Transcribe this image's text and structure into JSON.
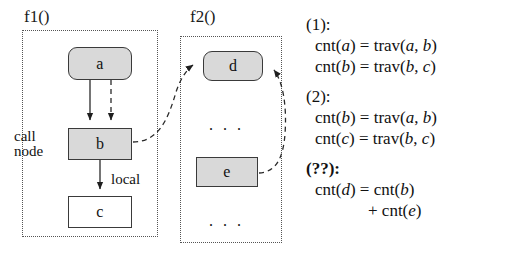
{
  "diagram": {
    "frames": [
      {
        "id": "f1",
        "label": "f1()"
      },
      {
        "id": "f2",
        "label": "f2()"
      }
    ],
    "nodes": [
      {
        "id": "a",
        "label": "a",
        "shape": "rounded",
        "fill": "#d9d9d9"
      },
      {
        "id": "b",
        "label": "b",
        "shape": "rect",
        "fill": "#d9d9d9"
      },
      {
        "id": "c",
        "label": "c",
        "shape": "rect",
        "fill": "#ffffff"
      },
      {
        "id": "d",
        "label": "d",
        "shape": "rounded",
        "fill": "#d9d9d9"
      },
      {
        "id": "e",
        "label": "e",
        "shape": "rect",
        "fill": "#d9d9d9"
      }
    ],
    "annotations": {
      "call_node": "call\nnode",
      "local_edge": "local",
      "ellipsis_f2_middle": ". . .",
      "ellipsis_f2_bottom": ". . ."
    },
    "colors": {
      "node_fill_gray": "#d9d9d9",
      "node_fill_white": "#ffffff",
      "stroke": "#3a3a3a",
      "frame_stroke": "#555555",
      "text": "#111111"
    }
  },
  "equations": [
    {
      "tag": "(1):",
      "bold_tag": false,
      "lines": [
        {
          "text": "cnt(a) = trav(a, b)",
          "indent": false
        },
        {
          "text": "cnt(b) = trav(b, c)",
          "indent": false
        }
      ]
    },
    {
      "tag": "(2):",
      "bold_tag": false,
      "lines": [
        {
          "text": "cnt(b) = trav(a, b)",
          "indent": false
        },
        {
          "text": "cnt(c) = trav(b, c)",
          "indent": false
        }
      ]
    },
    {
      "tag": "(??):",
      "bold_tag": true,
      "lines": [
        {
          "text": "cnt(d) = cnt(b)",
          "indent": false
        },
        {
          "text": "+ cnt(e)",
          "indent": true
        }
      ]
    }
  ]
}
